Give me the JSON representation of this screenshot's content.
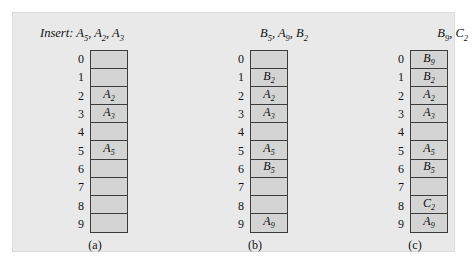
{
  "figure": {
    "background_color": "#e9e9e9",
    "cell_fill_color": "#d4d4d4",
    "border_color": "#3c3c3c"
  },
  "columns": [
    {
      "id": "a",
      "header": "Insert: A5, A2, A3",
      "header_parts": [
        {
          "text": "Insert: ",
          "sub": ""
        },
        {
          "text": "A",
          "sub": "5"
        },
        {
          "text": ", ",
          "sub": ""
        },
        {
          "text": "A",
          "sub": "2"
        },
        {
          "text": ", ",
          "sub": ""
        },
        {
          "text": "A",
          "sub": "3"
        }
      ],
      "caption": "(a)",
      "indices": [
        "0",
        "1",
        "2",
        "3",
        "4",
        "5",
        "6",
        "7",
        "8",
        "9"
      ],
      "slots": [
        {
          "index": "0",
          "letter": "",
          "sub": ""
        },
        {
          "index": "1",
          "letter": "",
          "sub": ""
        },
        {
          "index": "2",
          "letter": "A",
          "sub": "2"
        },
        {
          "index": "3",
          "letter": "A",
          "sub": "3"
        },
        {
          "index": "4",
          "letter": "",
          "sub": ""
        },
        {
          "index": "5",
          "letter": "A",
          "sub": "5"
        },
        {
          "index": "6",
          "letter": "",
          "sub": ""
        },
        {
          "index": "7",
          "letter": "",
          "sub": ""
        },
        {
          "index": "8",
          "letter": "",
          "sub": ""
        },
        {
          "index": "9",
          "letter": "",
          "sub": ""
        }
      ]
    },
    {
      "id": "b",
      "header": "B5, A9, B2",
      "header_parts": [
        {
          "text": "B",
          "sub": "5"
        },
        {
          "text": ", ",
          "sub": ""
        },
        {
          "text": "A",
          "sub": "9"
        },
        {
          "text": ", ",
          "sub": ""
        },
        {
          "text": "B",
          "sub": "2"
        }
      ],
      "caption": "(b)",
      "indices": [
        "0",
        "1",
        "2",
        "3",
        "4",
        "5",
        "6",
        "7",
        "8",
        "9"
      ],
      "slots": [
        {
          "index": "0",
          "letter": "",
          "sub": ""
        },
        {
          "index": "1",
          "letter": "B",
          "sub": "2"
        },
        {
          "index": "2",
          "letter": "A",
          "sub": "2"
        },
        {
          "index": "3",
          "letter": "A",
          "sub": "3"
        },
        {
          "index": "4",
          "letter": "",
          "sub": ""
        },
        {
          "index": "5",
          "letter": "A",
          "sub": "5"
        },
        {
          "index": "6",
          "letter": "B",
          "sub": "5"
        },
        {
          "index": "7",
          "letter": "",
          "sub": ""
        },
        {
          "index": "8",
          "letter": "",
          "sub": ""
        },
        {
          "index": "9",
          "letter": "A",
          "sub": "9"
        }
      ]
    },
    {
      "id": "c",
      "header": "B9, C2",
      "header_parts": [
        {
          "text": "B",
          "sub": "9"
        },
        {
          "text": ", ",
          "sub": ""
        },
        {
          "text": "C",
          "sub": "2"
        }
      ],
      "caption": "(c)",
      "indices": [
        "0",
        "1",
        "2",
        "3",
        "4",
        "5",
        "6",
        "7",
        "8",
        "9"
      ],
      "slots": [
        {
          "index": "0",
          "letter": "B",
          "sub": "9"
        },
        {
          "index": "1",
          "letter": "B",
          "sub": "2"
        },
        {
          "index": "2",
          "letter": "A",
          "sub": "2"
        },
        {
          "index": "3",
          "letter": "A",
          "sub": "3"
        },
        {
          "index": "4",
          "letter": "",
          "sub": ""
        },
        {
          "index": "5",
          "letter": "A",
          "sub": "5"
        },
        {
          "index": "6",
          "letter": "B",
          "sub": "5"
        },
        {
          "index": "7",
          "letter": "",
          "sub": ""
        },
        {
          "index": "8",
          "letter": "C",
          "sub": "2"
        },
        {
          "index": "9",
          "letter": "A",
          "sub": "9"
        }
      ]
    }
  ]
}
